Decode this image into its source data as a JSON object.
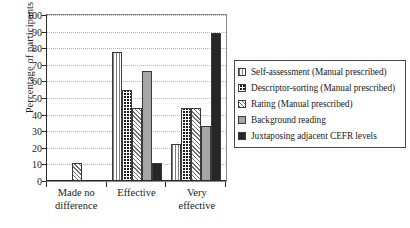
{
  "chart_data": {
    "type": "bar",
    "title": "",
    "xlabel": "",
    "ylabel": "Percentage of participants",
    "ylim": [
      0,
      100
    ],
    "ytick_step": 10,
    "yticks": [
      0,
      10,
      20,
      30,
      40,
      50,
      60,
      70,
      80,
      90,
      100
    ],
    "grid": true,
    "legend_position": "right",
    "categories": [
      "Made no difference",
      "Effective",
      "Very effective"
    ],
    "category_lines": [
      [
        "Made no",
        "difference"
      ],
      [
        "Effective",
        ""
      ],
      [
        "Very",
        "effective"
      ]
    ],
    "series": [
      {
        "name": "Self-assessment (Manual prescribed)",
        "pattern": "vertical-stripes",
        "color": "#7d7d7d",
        "values": [
          0,
          78,
          22
        ]
      },
      {
        "name": "Descriptor-sorting (Manual prescribed)",
        "pattern": "dark-checkerboard",
        "color": "#1c1c1c",
        "values": [
          0,
          55,
          44
        ]
      },
      {
        "name": "Rating (Manual prescribed)",
        "pattern": "diagonal-hatch",
        "color": "#6f6f6f",
        "values": [
          11,
          44,
          44
        ]
      },
      {
        "name": "Background reading",
        "pattern": "solid-gray",
        "color": "#a6a6a6",
        "values": [
          0,
          66,
          33
        ]
      },
      {
        "name": "Juxtaposing adjacent CEFR levels",
        "pattern": "solid-dark",
        "color": "#262626",
        "values": [
          0,
          11,
          89
        ]
      }
    ]
  }
}
